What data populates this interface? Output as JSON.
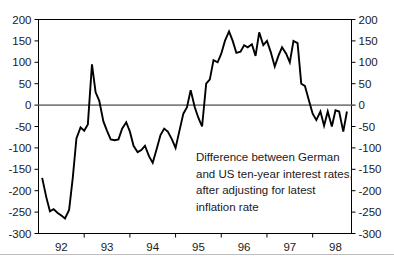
{
  "chart_data": {
    "type": "line",
    "title": "",
    "subtitle": "",
    "xlabel": "",
    "ylabel": "",
    "ylim": [
      -300,
      200
    ],
    "xlim": [
      1991.5,
      1998.35
    ],
    "grid": false,
    "legend_position": "none",
    "zero_reference_line": true,
    "y_ticks": [
      200,
      150,
      100,
      50,
      0,
      -50,
      -100,
      -150,
      -200,
      -250,
      -300
    ],
    "y_tick_labels_left": [
      "200",
      "150",
      "100",
      "50",
      "0",
      "-50",
      "-100",
      "-150",
      "-200",
      "-250",
      "-300"
    ],
    "y_tick_labels_right": [
      "200",
      "150",
      "100",
      "50",
      "0",
      "-50",
      "-100",
      "-150",
      "-200",
      "-250",
      "-300"
    ],
    "x_tick_labels": [
      "92",
      "93",
      "94",
      "95",
      "96",
      "97",
      "98"
    ],
    "x_tick_values": [
      1992,
      1993,
      1994,
      1995,
      1996,
      1997,
      1998
    ],
    "annotation": {
      "lines": [
        "Difference between German",
        "and US ten-year interest rates,",
        "after adjusting for latest",
        "inflation rate"
      ]
    },
    "series": [
      {
        "name": "German minus US real ten-year interest rate differential",
        "units": "basis points",
        "color": "#000000",
        "x": [
          1991.58,
          1991.67,
          1991.75,
          1991.83,
          1991.92,
          1992.0,
          1992.08,
          1992.17,
          1992.25,
          1992.33,
          1992.42,
          1992.5,
          1992.58,
          1992.67,
          1992.75,
          1992.83,
          1992.92,
          1993.0,
          1993.08,
          1993.17,
          1993.25,
          1993.33,
          1993.42,
          1993.5,
          1993.58,
          1993.67,
          1993.75,
          1993.83,
          1993.92,
          1994.0,
          1994.08,
          1994.17,
          1994.25,
          1994.33,
          1994.42,
          1994.5,
          1994.58,
          1994.67,
          1994.75,
          1994.83,
          1994.92,
          1995.0,
          1995.08,
          1995.17,
          1995.25,
          1995.33,
          1995.42,
          1995.5,
          1995.58,
          1995.67,
          1995.75,
          1995.83,
          1995.92,
          1996.0,
          1996.08,
          1996.17,
          1996.25,
          1996.33,
          1996.42,
          1996.5,
          1996.58,
          1996.67,
          1996.75,
          1996.83,
          1996.92,
          1997.0,
          1997.08,
          1997.17,
          1997.25,
          1997.33,
          1997.42,
          1997.5,
          1997.58,
          1997.67,
          1997.75,
          1997.83,
          1997.92,
          1998.0,
          1998.08,
          1998.17,
          1998.25
        ],
        "values": [
          -170,
          -215,
          -248,
          -243,
          -252,
          -258,
          -265,
          -245,
          -170,
          -78,
          -52,
          -60,
          -45,
          95,
          30,
          10,
          -38,
          -60,
          -80,
          -82,
          -80,
          -55,
          -40,
          -62,
          -95,
          -110,
          -105,
          -95,
          -120,
          -135,
          -105,
          -70,
          -55,
          -62,
          -80,
          -100,
          -62,
          -20,
          -5,
          35,
          -5,
          -30,
          -50,
          50,
          60,
          105,
          100,
          120,
          150,
          172,
          150,
          122,
          125,
          140,
          135,
          142,
          115,
          170,
          140,
          150,
          125,
          90,
          115,
          135,
          120,
          100,
          150,
          145,
          50,
          45,
          10,
          -20,
          -35,
          -15,
          -48,
          -15,
          -50,
          -12,
          -15,
          -62,
          -15
        ]
      }
    ]
  },
  "footer": {
    "ghost_text": ""
  }
}
